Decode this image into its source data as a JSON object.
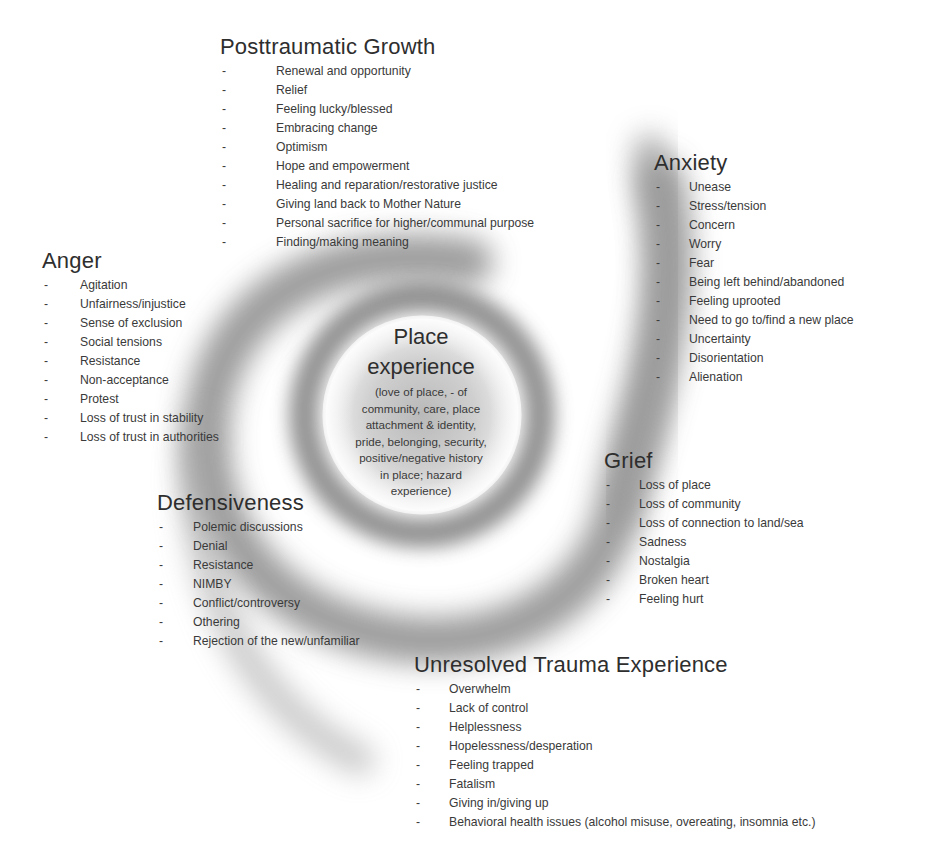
{
  "center": {
    "title_line1": "Place",
    "title_line2": "experience",
    "description_lines": [
      "(love of place, - of",
      "community, care, place",
      "attachment & identity,",
      "pride, belonging, security,",
      "positive/negative history",
      "in place; hazard",
      "experience)"
    ]
  },
  "groups": {
    "posttraumatic_growth": {
      "title": "Posttraumatic Growth",
      "items": [
        "Renewal and opportunity",
        "Relief",
        "Feeling lucky/blessed",
        "Embracing change",
        "Optimism",
        "Hope and empowerment",
        "Healing and reparation/restorative justice",
        "Giving land back to Mother  Nature",
        "Personal sacrifice for higher/communal purpose",
        "Finding/making meaning"
      ]
    },
    "anxiety": {
      "title": "Anxiety",
      "items": [
        "Unease",
        "Stress/tension",
        "Concern",
        "Worry",
        "Fear",
        "Being left behind/abandoned",
        "Feeling uprooted",
        "Need to go to/find a new place",
        "Uncertainty",
        "Disorientation",
        "Alienation"
      ]
    },
    "anger": {
      "title": "Anger",
      "items": [
        "Agitation",
        "Unfairness/injustice",
        "Sense of exclusion",
        "Social tensions",
        "Resistance",
        "Non-acceptance",
        "Protest",
        "Loss of trust in stability",
        "Loss of trust in authorities"
      ]
    },
    "grief": {
      "title": "Grief",
      "items": [
        "Loss of place",
        "Loss of community",
        "Loss of connection to land/sea",
        "Sadness",
        "Nostalgia",
        "Broken heart",
        "Feeling hurt"
      ]
    },
    "defensiveness": {
      "title": "Defensiveness",
      "items": [
        "Polemic discussions",
        "Denial",
        "Resistance",
        "NIMBY",
        "Conflict/controversy",
        "Othering",
        "Rejection of the new/unfamiliar"
      ]
    },
    "unresolved_trauma": {
      "title": "Unresolved Trauma Experience",
      "items": [
        "Overwhelm",
        "Lack of control",
        "Helplessness",
        "Hopelessness/desperation",
        "Feeling trapped",
        "Fatalism",
        "Giving in/giving up",
        "Behavioral health issues (alcohol misuse, overeating, insomnia etc.)"
      ]
    }
  },
  "bullet_glyph": "-",
  "colors": {
    "background": "#ffffff",
    "text": "#333333",
    "spiral": "#7a7a7a"
  }
}
